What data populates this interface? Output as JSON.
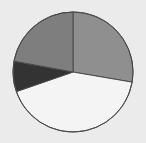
{
  "chart_data": {
    "type": "pie",
    "title": "",
    "start_angle_deg": 0,
    "direction": "clockwise",
    "legend": "none",
    "slices": [
      {
        "label": "",
        "value": 27.7,
        "color": "#8f8f8f"
      },
      {
        "label": "",
        "value": 42.0,
        "color": "#f4f4f4"
      },
      {
        "label": "",
        "value": 8.2,
        "color": "#333333"
      },
      {
        "label": "",
        "value": 22.1,
        "color": "#7e7e7e"
      }
    ],
    "values": [
      27.7,
      42.0,
      8.2,
      22.1
    ]
  },
  "style": {
    "background": "#ebebeb",
    "stroke": "#4a4a4a",
    "center": [
      73,
      72
    ],
    "radius": 60
  }
}
